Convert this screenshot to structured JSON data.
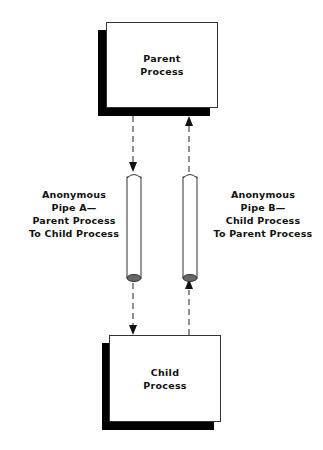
{
  "nodes": {
    "parent": {
      "label": "Parent\nProcess"
    },
    "child": {
      "label": "Child\nProcess"
    }
  },
  "pipes": [
    {
      "id": "pipe-a",
      "label": "Anonymous\nPipe A—\nParent Process\nTo Child Process",
      "direction": "parent-to-child"
    },
    {
      "id": "pipe-b",
      "label": "Anonymous\nPipe B—\nChild Process\nTo Parent Process",
      "direction": "child-to-parent"
    }
  ],
  "colors": {
    "shadow": "#000000",
    "pipe_end": "#666666",
    "line": "#222222"
  }
}
